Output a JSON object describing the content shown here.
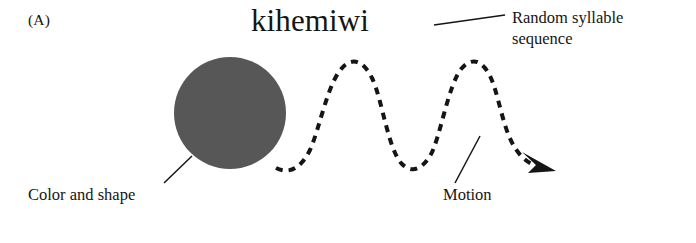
{
  "figure": {
    "panel_label": "(A)",
    "background_color": "#ffffff",
    "ink_color": "#151515",
    "width": 696,
    "height": 243
  },
  "stimulus": {
    "word": "kihemiwi",
    "word_font_size_px": 31
  },
  "shape": {
    "name": "circle",
    "fill_color": "#575757",
    "center_x": 230,
    "center_y": 113,
    "radius": 56
  },
  "motion_path": {
    "name": "dashed-sine-wave",
    "stroke_color": "#151515",
    "stroke_width": 4,
    "dash_pattern": "7 6",
    "peaks_x": [
      350,
      470
    ],
    "troughs_x": [
      290,
      410
    ],
    "peak_y": 62,
    "trough_y": 166,
    "arrowhead": "right-down"
  },
  "callouts": [
    {
      "id": "syllable",
      "line1": "Random syllable",
      "line2": "sequence",
      "leader_from_x": 434,
      "leader_from_y": 25,
      "leader_to_x": 505,
      "leader_to_y": 15
    },
    {
      "id": "color-shape",
      "text": "Color and shape",
      "leader_from_x": 192,
      "leader_from_y": 156,
      "leader_to_x": 164,
      "leader_to_y": 183
    },
    {
      "id": "motion",
      "text": "Motion",
      "leader_from_x": 480,
      "leader_from_y": 136,
      "leader_to_x": 455,
      "leader_to_y": 183
    }
  ]
}
